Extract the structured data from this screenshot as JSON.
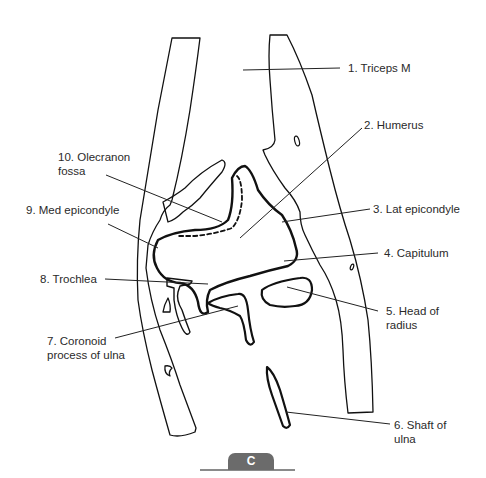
{
  "figure": {
    "panel_label": "C",
    "labels": [
      {
        "id": 1,
        "text": "1. Triceps M"
      },
      {
        "id": 2,
        "text": "2. Humerus"
      },
      {
        "id": 3,
        "text": "3. Lat epicondyle"
      },
      {
        "id": 4,
        "text": "4. Capitulum"
      },
      {
        "id": 5,
        "text": "5. Head of\nradius"
      },
      {
        "id": 6,
        "text": "6. Shaft of\nulna"
      },
      {
        "id": 7,
        "text": "7. Coronoid\nprocess of ulna"
      },
      {
        "id": 8,
        "text": "8. Trochlea"
      },
      {
        "id": 9,
        "text": "9. Med epicondyle"
      },
      {
        "id": 10,
        "text": "10. Olecranon\nfossa"
      }
    ]
  }
}
